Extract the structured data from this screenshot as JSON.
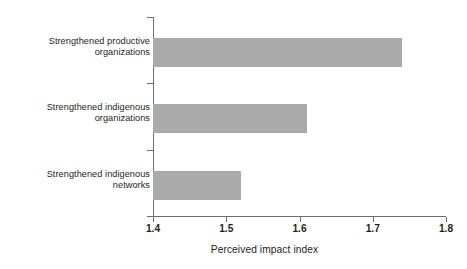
{
  "chart_data": {
    "type": "bar",
    "orientation": "horizontal",
    "title": "",
    "subtitle": "",
    "xlabel": "Perceived impact index",
    "ylabel": "",
    "categories": [
      "Strengthened productive\norganizations",
      "Strengthened indigenous\norganizations",
      "Strengthened indigenous\nnetworks"
    ],
    "values": [
      1.74,
      1.61,
      1.52
    ],
    "xlim": [
      1.4,
      1.8
    ],
    "xticks": [
      1.4,
      1.5,
      1.6,
      1.7,
      1.8
    ],
    "xtick_labels": [
      "1.4",
      "1.5",
      "1.6",
      "1.7",
      "1.8"
    ],
    "grid": false,
    "legend": null,
    "bar_color": "#aaaaab",
    "axis_color": "#6d6e70",
    "text_color": "#231f20",
    "background": "#ffffff"
  }
}
